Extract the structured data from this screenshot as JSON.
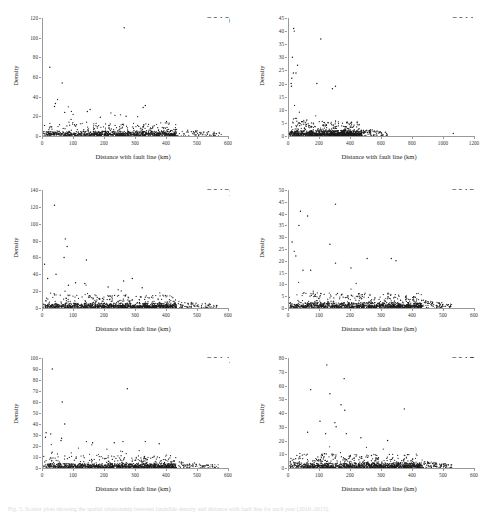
{
  "figure": {
    "caption": "Fig. 5. Scatter plots showing the spatial relationship between landslide density and distance with fault line for each year (2010–2015).",
    "axis_title_x": "Distance with fault line (km)",
    "axis_title_y": "Density",
    "dot_color": "#1a1a1a",
    "axis_color": "#9a9a9a",
    "background": "#ffffff"
  },
  "chart_data": [
    {
      "type": "scatter",
      "title": "2010",
      "xlabel": "Distance with fault line (km)",
      "ylabel": "Density",
      "xlim": [
        0,
        600
      ],
      "ylim": [
        0,
        120
      ],
      "xticks": [
        0,
        100,
        200,
        300,
        400,
        500,
        600
      ],
      "yticks": [
        0,
        20,
        40,
        60,
        80,
        100,
        120
      ],
      "grid": false,
      "n_points": 620,
      "notable_points": [
        {
          "x": 262,
          "y": 110
        },
        {
          "x": 22,
          "y": 70
        },
        {
          "x": 62,
          "y": 54
        },
        {
          "x": 47,
          "y": 37
        },
        {
          "x": 40,
          "y": 33
        },
        {
          "x": 37,
          "y": 30
        },
        {
          "x": 330,
          "y": 31
        },
        {
          "x": 323,
          "y": 29
        },
        {
          "x": 152,
          "y": 27
        },
        {
          "x": 143,
          "y": 25
        },
        {
          "x": 70,
          "y": 24
        },
        {
          "x": 97,
          "y": 22
        },
        {
          "x": 232,
          "y": 21
        },
        {
          "x": 268,
          "y": 20
        },
        {
          "x": 185,
          "y": 19
        }
      ],
      "bulk_description": "Dense band of points below y=10 spanning x=0 to x=430, thinning to sparse isolated points out to x=570."
    },
    {
      "type": "scatter",
      "title": "2011",
      "xlabel": "Distance with fault line (km)",
      "ylabel": "Density",
      "xlim": [
        0,
        1200
      ],
      "ylim": [
        0,
        45
      ],
      "xticks": [
        0,
        200,
        400,
        600,
        800,
        1000,
        1200
      ],
      "yticks": [
        0,
        5,
        10,
        15,
        20,
        25,
        30,
        35,
        40,
        45
      ],
      "grid": false,
      "n_points": 700,
      "notable_points": [
        {
          "x": 30,
          "y": 41
        },
        {
          "x": 34,
          "y": 40
        },
        {
          "x": 205,
          "y": 37
        },
        {
          "x": 22,
          "y": 30
        },
        {
          "x": 55,
          "y": 27
        },
        {
          "x": 28,
          "y": 24
        },
        {
          "x": 45,
          "y": 24
        },
        {
          "x": 18,
          "y": 22
        },
        {
          "x": 14,
          "y": 20
        },
        {
          "x": 16,
          "y": 19
        },
        {
          "x": 180,
          "y": 20
        },
        {
          "x": 300,
          "y": 19
        },
        {
          "x": 280,
          "y": 18
        },
        {
          "x": 1060,
          "y": 1
        }
      ],
      "bulk_description": "Very dense saturated band from y=0 to y=6 spanning x=0 to x=460; scattered mid-density points up to y=20 concentrated below x=350; sparse tail to x=620 plus one isolated point near x=1060."
    },
    {
      "type": "scatter",
      "title": "2012",
      "xlabel": "Distance with fault line (km)",
      "ylabel": "Density",
      "xlim": [
        0,
        600
      ],
      "ylim": [
        0,
        140
      ],
      "xticks": [
        0,
        100,
        200,
        300,
        400,
        500,
        600
      ],
      "yticks": [
        0,
        20,
        40,
        60,
        80,
        100,
        120,
        140
      ],
      "grid": false,
      "n_points": 700,
      "notable_points": [
        {
          "x": 37,
          "y": 122
        },
        {
          "x": 72,
          "y": 82
        },
        {
          "x": 78,
          "y": 73
        },
        {
          "x": 68,
          "y": 60
        },
        {
          "x": 140,
          "y": 57
        },
        {
          "x": 5,
          "y": 52
        },
        {
          "x": 42,
          "y": 40
        },
        {
          "x": 15,
          "y": 35
        },
        {
          "x": 288,
          "y": 35
        },
        {
          "x": 260,
          "y": 32
        },
        {
          "x": 105,
          "y": 30
        },
        {
          "x": 135,
          "y": 29
        },
        {
          "x": 82,
          "y": 27
        },
        {
          "x": 210,
          "y": 25
        },
        {
          "x": 320,
          "y": 24
        }
      ],
      "bulk_description": "Dense low band below y=12 from x=0 to x=470, with moderate spread to y=25 below x=350; sparse scattered points extend to x=560."
    },
    {
      "type": "scatter",
      "title": "2013",
      "xlabel": "Distance with fault line (km)",
      "ylabel": "Density",
      "xlim": [
        0,
        600
      ],
      "ylim": [
        0,
        50
      ],
      "xticks": [
        0,
        100,
        200,
        300,
        400,
        500,
        600
      ],
      "yticks": [
        0,
        5,
        10,
        15,
        20,
        25,
        30,
        35,
        40,
        45,
        50
      ],
      "grid": false,
      "n_points": 720,
      "notable_points": [
        {
          "x": 150,
          "y": 44
        },
        {
          "x": 37,
          "y": 41
        },
        {
          "x": 60,
          "y": 39
        },
        {
          "x": 32,
          "y": 35
        },
        {
          "x": 10,
          "y": 28
        },
        {
          "x": 132,
          "y": 27
        },
        {
          "x": 17,
          "y": 24
        },
        {
          "x": 22,
          "y": 22
        },
        {
          "x": 252,
          "y": 21
        },
        {
          "x": 330,
          "y": 21
        },
        {
          "x": 345,
          "y": 20
        },
        {
          "x": 150,
          "y": 19
        },
        {
          "x": 200,
          "y": 17
        },
        {
          "x": 45,
          "y": 16
        },
        {
          "x": 70,
          "y": 16
        }
      ],
      "bulk_description": "Dense saturated band below y=4 from x=0 to x=400; moderate scatter to y=12 across x=0–380; sparse points out to x=520."
    },
    {
      "type": "scatter",
      "title": "2014",
      "xlabel": "Distance with fault line (km)",
      "ylabel": "Density",
      "xlim": [
        0,
        600
      ],
      "ylim": [
        0,
        100
      ],
      "xticks": [
        0,
        100,
        200,
        300,
        400,
        500,
        600
      ],
      "yticks": [
        0,
        10,
        20,
        30,
        40,
        50,
        60,
        70,
        80,
        90,
        100
      ],
      "grid": false,
      "n_points": 680,
      "notable_points": [
        {
          "x": 30,
          "y": 90
        },
        {
          "x": 272,
          "y": 72
        },
        {
          "x": 62,
          "y": 60
        },
        {
          "x": 70,
          "y": 40
        },
        {
          "x": 10,
          "y": 32
        },
        {
          "x": 25,
          "y": 31
        },
        {
          "x": 8,
          "y": 28
        },
        {
          "x": 60,
          "y": 27
        },
        {
          "x": 58,
          "y": 25
        },
        {
          "x": 140,
          "y": 24
        },
        {
          "x": 160,
          "y": 23
        },
        {
          "x": 230,
          "y": 23
        },
        {
          "x": 258,
          "y": 24
        },
        {
          "x": 330,
          "y": 24
        },
        {
          "x": 375,
          "y": 22
        }
      ],
      "bulk_description": "Dense band below y=8 from x=0 to x=430; moderate spread to y=16 below x=350; sparse trailing points to x=560."
    },
    {
      "type": "scatter",
      "title": "2015",
      "xlabel": "Distance with fault line (km)",
      "ylabel": "Density",
      "xlim": [
        0,
        600
      ],
      "ylim": [
        0,
        80
      ],
      "xticks": [
        0,
        100,
        200,
        300,
        400,
        500,
        600
      ],
      "yticks": [
        0,
        10,
        20,
        30,
        40,
        50,
        60,
        70,
        80
      ],
      "grid": false,
      "n_points": 760,
      "notable_points": [
        {
          "x": 122,
          "y": 75
        },
        {
          "x": 178,
          "y": 65
        },
        {
          "x": 70,
          "y": 57
        },
        {
          "x": 132,
          "y": 54
        },
        {
          "x": 168,
          "y": 46
        },
        {
          "x": 180,
          "y": 42
        },
        {
          "x": 372,
          "y": 43
        },
        {
          "x": 100,
          "y": 34
        },
        {
          "x": 148,
          "y": 33
        },
        {
          "x": 152,
          "y": 30
        },
        {
          "x": 60,
          "y": 26
        },
        {
          "x": 118,
          "y": 25
        },
        {
          "x": 185,
          "y": 25
        },
        {
          "x": 232,
          "y": 22
        },
        {
          "x": 318,
          "y": 20
        }
      ],
      "bulk_description": "Very dense band below y=6 from x=0 to x=430; moderate scatter to y=15 across x=0–400; sparse points to x=520."
    }
  ]
}
